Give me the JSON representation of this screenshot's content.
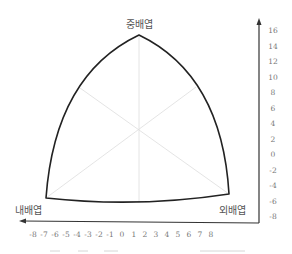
{
  "diagram": {
    "type": "reuleaux-triangle-germ-layers",
    "vertices": {
      "top": {
        "label": "중배엽",
        "x": 139,
        "y": 35
      },
      "left": {
        "label": "내배엽",
        "x": 46,
        "y": 198
      },
      "right": {
        "label": "외배엽",
        "x": 229,
        "y": 194
      }
    },
    "center": {
      "x": 139,
      "y": 131
    },
    "colors": {
      "outline": "#222222",
      "inner_lines": "#dddddd",
      "axis": "#333333",
      "label_text": "#555555",
      "tick_text": "#777777"
    },
    "y_axis": {
      "ticks": [
        "16",
        "14",
        "12",
        "10",
        "8",
        "6",
        "4",
        "2",
        "0",
        "-2",
        "-4",
        "-6",
        "-8"
      ]
    },
    "x_axis": {
      "ticks": [
        "-8",
        "-7",
        "-6",
        "-5",
        "-4",
        "-3",
        "-2",
        "-1",
        "0",
        "1",
        "2",
        "3",
        "4",
        "5",
        "6",
        "7",
        "8"
      ]
    },
    "caption": ""
  }
}
